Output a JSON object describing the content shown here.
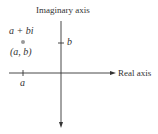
{
  "diagram": {
    "type": "complex-plane",
    "vertical_axis_label": "Imaginary axis",
    "horizontal_axis_label": "Real axis",
    "point": {
      "expression": "a + bi",
      "coordinates": "(a, b)"
    },
    "ticks": {
      "real": "a",
      "imaginary": "b"
    },
    "colors": {
      "axis": "#333333",
      "point": "#9a9a9a",
      "text": "#333333"
    }
  }
}
